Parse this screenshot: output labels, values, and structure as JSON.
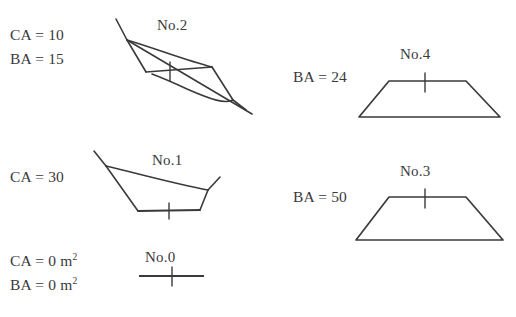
{
  "figure": {
    "background_color": "#ffffff",
    "stroke_color": "#3a3a3a",
    "text_color": "#3a3a3a",
    "measurements": {
      "no2_ca": "CA = 10",
      "no2_ba": "BA = 15",
      "no1_ca": "CA = 30",
      "no0_ca_prefix": "CA = 0 m",
      "no0_ca_sup": "2",
      "no0_ba_prefix": "BA = 0 m",
      "no0_ba_sup": "2",
      "no4_ba": "BA = 24",
      "no3_ba": "BA = 50"
    },
    "shape_labels": {
      "no2": "No.2",
      "no1": "No.1",
      "no0": "No.0",
      "no4": "No.4",
      "no3": "No.3"
    },
    "shapes": [
      {
        "id": "no2",
        "label": "No.2",
        "type": "self-intersecting-polygon",
        "outline_points": "116,19 127,39 153,67 212,67 233,100 247,110 187,89 146,72 127,39",
        "chord_points": "127,39 247,110",
        "baseline_points": "146,72 212,67",
        "tick": {
          "x": 170,
          "y1": 62,
          "y2": 80
        }
      },
      {
        "id": "no1",
        "label": "No.1",
        "type": "polygon",
        "outline_points": "94,151 104,165 170,182 206,190 218,177 212,196 200,209 138,210 131,198",
        "baseline_points": "138,210 200,209",
        "tick": {
          "x": 169,
          "y1": 203,
          "y2": 218
        }
      },
      {
        "id": "no0",
        "label": "No.0",
        "type": "segment",
        "segment": {
          "x1": 139,
          "y1": 276,
          "x2": 203,
          "y2": 276
        },
        "tick": {
          "x": 172,
          "y1": 268,
          "y2": 286
        }
      },
      {
        "id": "no4",
        "label": "No.4",
        "type": "trapezoid",
        "outline_points": "389,81 466,81 500,117 359,117",
        "baseline_points": "389,81 466,81",
        "tick": {
          "x": 425,
          "y1": 74,
          "y2": 92
        }
      },
      {
        "id": "no3",
        "label": "No.3",
        "type": "trapezoid",
        "outline_points": "389,197 466,197 503,240 356,240",
        "baseline_points": "389,197 466,197",
        "tick": {
          "x": 425,
          "y1": 190,
          "y2": 208
        }
      }
    ]
  }
}
